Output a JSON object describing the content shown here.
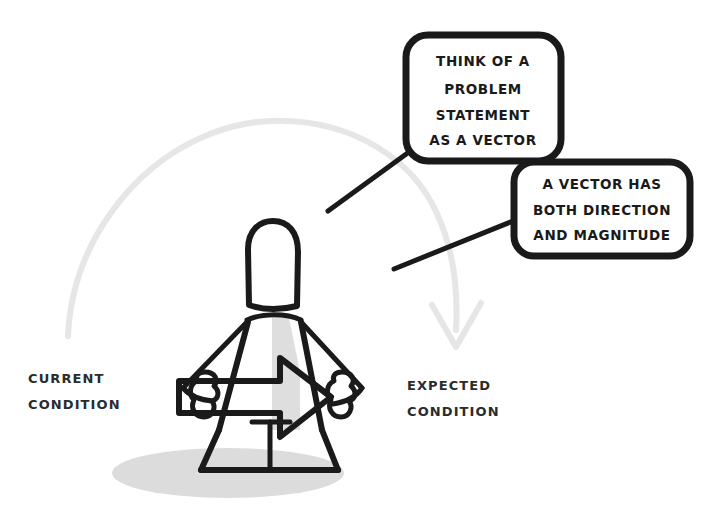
{
  "canvas": {
    "width": 709,
    "height": 511,
    "background_color": "#ffffff"
  },
  "palette": {
    "ink": "#1a1a1a",
    "ghost_arc": "#e6e6e6",
    "body_shade": "#dedede",
    "ground_shadow": "#dcdcdc",
    "bubble_fill": "#ffffff",
    "caption_ink": "#2b2b2b"
  },
  "speech_bubbles": [
    {
      "id": "bubble-problem-statement",
      "lines": [
        "THINK OF A",
        "PROBLEM",
        "STATEMENT",
        "AS A VECTOR"
      ]
    },
    {
      "id": "bubble-vector-definition",
      "lines": [
        "A VECTOR HAS",
        "BOTH DIRECTION",
        "AND MAGNITUDE"
      ]
    }
  ],
  "captions": {
    "left": {
      "id": "caption-current-condition",
      "lines": [
        "CURRENT",
        "CONDITION"
      ]
    },
    "right": {
      "id": "caption-expected-condition",
      "lines": [
        "EXPECTED",
        "CONDITION"
      ]
    }
  },
  "figure": {
    "id": "stick-figure-person",
    "torso_arrow": "arrow-pointing-right"
  },
  "arc": {
    "id": "transition-arc-arrow",
    "direction": "left-to-right",
    "arrowhead": "down"
  }
}
